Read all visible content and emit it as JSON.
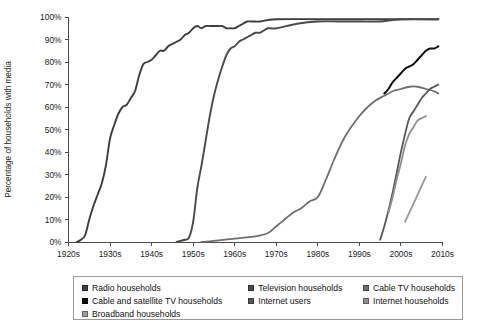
{
  "chart_data": {
    "type": "line",
    "title": "",
    "xlabel": "",
    "ylabel": "Percentage of households with media",
    "ylim": [
      0,
      100
    ],
    "xlim": [
      1920,
      2010
    ],
    "grid": false,
    "legend_position": "bottom",
    "ytick_labels": [
      "0%",
      "10%",
      "20%",
      "30%",
      "40%",
      "50%",
      "60%",
      "70%",
      "80%",
      "90%",
      "100%"
    ],
    "ytick_values": [
      0,
      10,
      20,
      30,
      40,
      50,
      60,
      70,
      80,
      90,
      100
    ],
    "xtick_labels": [
      "1920s",
      "1930s",
      "1940s",
      "1950s",
      "1960s",
      "1970s",
      "1980s",
      "1990s",
      "2000s",
      "2010s"
    ],
    "xtick_values": [
      1920,
      1930,
      1940,
      1950,
      1960,
      1970,
      1980,
      1990,
      2000,
      2010
    ],
    "series": [
      {
        "name": "Radio households",
        "color": "#3d3d3d",
        "width": 1.9,
        "points": [
          [
            1922,
            0
          ],
          [
            1923,
            1
          ],
          [
            1924,
            3
          ],
          [
            1925,
            10
          ],
          [
            1926,
            16
          ],
          [
            1927,
            21
          ],
          [
            1928,
            26
          ],
          [
            1929,
            34
          ],
          [
            1930,
            46
          ],
          [
            1931,
            52
          ],
          [
            1932,
            57
          ],
          [
            1933,
            60
          ],
          [
            1934,
            61
          ],
          [
            1935,
            64
          ],
          [
            1936,
            67
          ],
          [
            1937,
            74
          ],
          [
            1938,
            79
          ],
          [
            1939,
            80
          ],
          [
            1940,
            81
          ],
          [
            1941,
            83
          ],
          [
            1942,
            85
          ],
          [
            1943,
            85
          ],
          [
            1944,
            87
          ],
          [
            1945,
            88
          ],
          [
            1946,
            89
          ],
          [
            1947,
            90
          ],
          [
            1948,
            92
          ],
          [
            1949,
            93
          ],
          [
            1950,
            95
          ],
          [
            1951,
            96
          ],
          [
            1952,
            95
          ],
          [
            1953,
            96
          ],
          [
            1954,
            96
          ],
          [
            1955,
            96
          ],
          [
            1956,
            96
          ],
          [
            1957,
            96
          ],
          [
            1958,
            95
          ],
          [
            1959,
            95
          ],
          [
            1960,
            95
          ],
          [
            1961,
            96
          ],
          [
            1962,
            97
          ],
          [
            1963,
            98
          ],
          [
            1964,
            98
          ],
          [
            1965,
            98
          ],
          [
            1966,
            98
          ],
          [
            1970,
            99
          ],
          [
            1980,
            99
          ],
          [
            1990,
            99
          ],
          [
            2000,
            99
          ],
          [
            2009,
            99
          ]
        ]
      },
      {
        "name": "Television households",
        "color": "#4a4a4a",
        "width": 1.9,
        "points": [
          [
            1946,
            0
          ],
          [
            1947,
            0.5
          ],
          [
            1948,
            1
          ],
          [
            1949,
            2
          ],
          [
            1950,
            9
          ],
          [
            1951,
            24
          ],
          [
            1952,
            34
          ],
          [
            1953,
            45
          ],
          [
            1954,
            56
          ],
          [
            1955,
            65
          ],
          [
            1956,
            72
          ],
          [
            1957,
            78
          ],
          [
            1958,
            83
          ],
          [
            1959,
            86
          ],
          [
            1960,
            87
          ],
          [
            1961,
            89
          ],
          [
            1962,
            90
          ],
          [
            1963,
            91
          ],
          [
            1964,
            92
          ],
          [
            1965,
            93
          ],
          [
            1966,
            93
          ],
          [
            1967,
            94
          ],
          [
            1968,
            95
          ],
          [
            1970,
            95
          ],
          [
            1975,
            97
          ],
          [
            1980,
            98
          ],
          [
            1985,
            98
          ],
          [
            1990,
            98
          ],
          [
            1995,
            98
          ],
          [
            2000,
            99
          ],
          [
            2009,
            99
          ]
        ]
      },
      {
        "name": "Cable TV households",
        "color": "#6e6e6e",
        "width": 1.8,
        "points": [
          [
            1952,
            0
          ],
          [
            1955,
            0.5
          ],
          [
            1960,
            1.5
          ],
          [
            1965,
            2.5
          ],
          [
            1968,
            4
          ],
          [
            1970,
            7
          ],
          [
            1972,
            10
          ],
          [
            1974,
            13
          ],
          [
            1976,
            15
          ],
          [
            1978,
            18
          ],
          [
            1980,
            20
          ],
          [
            1982,
            28
          ],
          [
            1984,
            37
          ],
          [
            1986,
            45
          ],
          [
            1988,
            51
          ],
          [
            1990,
            56
          ],
          [
            1992,
            60
          ],
          [
            1994,
            63
          ],
          [
            1996,
            65
          ],
          [
            1998,
            67
          ],
          [
            2000,
            68
          ],
          [
            2002,
            69
          ],
          [
            2004,
            69
          ],
          [
            2006,
            68
          ],
          [
            2008,
            67
          ],
          [
            2009,
            66
          ]
        ]
      },
      {
        "name": "Cable and satellite TV households",
        "color": "#0d0d0d",
        "width": 2.0,
        "points": [
          [
            1996,
            66
          ],
          [
            1997,
            68
          ],
          [
            1998,
            71
          ],
          [
            1999,
            73
          ],
          [
            2000,
            75
          ],
          [
            2001,
            77
          ],
          [
            2002,
            78
          ],
          [
            2003,
            79
          ],
          [
            2004,
            81
          ],
          [
            2005,
            83
          ],
          [
            2006,
            85
          ],
          [
            2007,
            86
          ],
          [
            2008,
            86
          ],
          [
            2009,
            87
          ]
        ]
      },
      {
        "name": "Internet users",
        "color": "#585858",
        "width": 1.8,
        "points": [
          [
            1995,
            1
          ],
          [
            1996,
            7
          ],
          [
            1997,
            14
          ],
          [
            1998,
            22
          ],
          [
            1999,
            31
          ],
          [
            2000,
            40
          ],
          [
            2001,
            48
          ],
          [
            2002,
            55
          ],
          [
            2003,
            58
          ],
          [
            2004,
            61
          ],
          [
            2005,
            64
          ],
          [
            2006,
            66
          ],
          [
            2007,
            68
          ],
          [
            2008,
            69
          ],
          [
            2009,
            70
          ]
        ]
      },
      {
        "name": "Internet households",
        "color": "#8f8f8f",
        "width": 1.8,
        "points": [
          [
            1997,
            13
          ],
          [
            1998,
            20
          ],
          [
            1999,
            28
          ],
          [
            2000,
            35
          ],
          [
            2001,
            43
          ],
          [
            2002,
            48
          ],
          [
            2003,
            51
          ],
          [
            2004,
            54
          ],
          [
            2005,
            55
          ],
          [
            2006,
            56
          ]
        ]
      },
      {
        "name": "Broadband households",
        "color": "#9c9c9c",
        "width": 1.8,
        "points": [
          [
            2001,
            9
          ],
          [
            2002,
            13
          ],
          [
            2003,
            17
          ],
          [
            2004,
            21
          ],
          [
            2005,
            25
          ],
          [
            2006,
            29
          ]
        ]
      }
    ]
  },
  "legend": {
    "rows": [
      [
        {
          "label": "Radio households",
          "color": "#3d3d3d",
          "icon": "legend-swatch-radio"
        },
        {
          "label": "Television households",
          "color": "#4a4a4a",
          "icon": "legend-swatch-television"
        },
        {
          "label": "Cable TV households",
          "color": "#6e6e6e",
          "icon": "legend-swatch-cable-tv"
        }
      ],
      [
        {
          "label": "Cable and satellite TV households",
          "color": "#0d0d0d",
          "icon": "legend-swatch-cable-satellite"
        },
        {
          "label": "Internet users",
          "color": "#585858",
          "icon": "legend-swatch-internet-users"
        },
        {
          "label": "Internet households",
          "color": "#8f8f8f",
          "icon": "legend-swatch-internet-households"
        }
      ],
      [
        {
          "label": "Broadband households",
          "color": "#9c9c9c",
          "icon": "legend-swatch-broadband"
        }
      ]
    ]
  }
}
